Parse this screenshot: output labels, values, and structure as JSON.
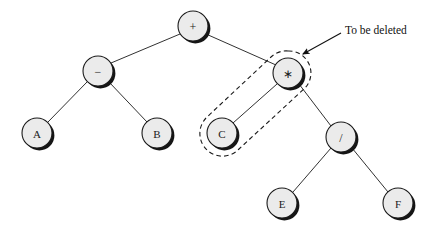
{
  "figure": {
    "background_color": "#ffffff",
    "node_fill": "#ebebeb",
    "node_stroke": "#1a1a1a",
    "shadow_color": "#111111",
    "edge_color": "#1a1a1a",
    "dashed_color": "#1a1a1a",
    "text_color": "#111111"
  },
  "nodes": [
    {
      "id": "root",
      "label": "+",
      "cx": 193,
      "cy": 26,
      "r": 15,
      "kind": "operator"
    },
    {
      "id": "minus",
      "label": "−",
      "cx": 98,
      "cy": 71,
      "r": 15,
      "kind": "operator"
    },
    {
      "id": "times",
      "label": "∗",
      "cx": 288,
      "cy": 73,
      "r": 15,
      "kind": "operator"
    },
    {
      "id": "a",
      "label": "A",
      "cx": 37,
      "cy": 133,
      "r": 15,
      "kind": "operand"
    },
    {
      "id": "b",
      "label": "B",
      "cx": 157,
      "cy": 133,
      "r": 15,
      "kind": "operand"
    },
    {
      "id": "c",
      "label": "C",
      "cx": 222,
      "cy": 133,
      "r": 15,
      "kind": "operand"
    },
    {
      "id": "div",
      "label": "/",
      "cx": 341,
      "cy": 137,
      "r": 15,
      "kind": "operator"
    },
    {
      "id": "e",
      "label": "E",
      "cx": 282,
      "cy": 203,
      "r": 15,
      "kind": "operand"
    },
    {
      "id": "f",
      "label": "F",
      "cx": 398,
      "cy": 203,
      "r": 15,
      "kind": "operand"
    }
  ],
  "edges": [
    {
      "from": "root",
      "to": "minus"
    },
    {
      "from": "root",
      "to": "times"
    },
    {
      "from": "minus",
      "to": "a"
    },
    {
      "from": "minus",
      "to": "b"
    },
    {
      "from": "times",
      "to": "c"
    },
    {
      "from": "times",
      "to": "div"
    },
    {
      "from": "div",
      "to": "e"
    },
    {
      "from": "div",
      "to": "f"
    }
  ],
  "selection": {
    "shape": "capsule",
    "encloses": [
      "times",
      "c"
    ],
    "style": "dashed"
  },
  "annotation": {
    "text": "To be deleted",
    "text_x": 343,
    "text_y": 32,
    "arrow_from_x": 341,
    "arrow_from_y": 33,
    "arrow_to_x": 302,
    "arrow_to_y": 54
  }
}
